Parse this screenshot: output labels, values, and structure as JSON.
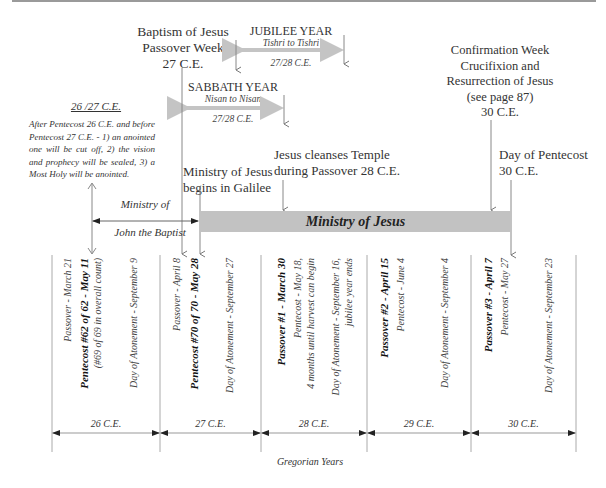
{
  "top_labels": {
    "baptism": [
      "Baptism of Jesus",
      "Passover Week",
      "27 C.E."
    ],
    "jubilee": {
      "title": "JUBILEE YEAR",
      "range": "Tishri to Tishri",
      "year": "27/28 C.E."
    },
    "sabbath": {
      "title": "SABBATH YEAR",
      "range": "Nisan to Nisan",
      "year": "27/28 C.E."
    },
    "confirmation": [
      "Confirmation Week",
      "Crucifixion and",
      "Resurrection of Jesus",
      "(see page 87)",
      "30 C.E."
    ],
    "note": {
      "heading": "26 /27 C.E.",
      "body": "After Pentecost 26 C.E. and before Pentecost 27 C.E. - 1) an anointed one will be cut off, 2) the vision and prophecy will be sealed, 3) a Most Holy will be anointed."
    },
    "ministry_galilee": [
      "Ministry of Jesus",
      "begins in Galilee"
    ],
    "cleanses_temple": [
      "Jesus cleanses Temple",
      "during Passover 28 C.E."
    ],
    "pentecost_30": [
      "Day of Pentecost",
      "30 C.E."
    ]
  },
  "john_baptist": [
    "Ministry of",
    "John the Baptist"
  ],
  "ministry_bar": {
    "label": "Ministry of Jesus",
    "color": "#c2c2c2"
  },
  "columns": [
    {
      "x": 68,
      "lines": [
        "Passover - March 21"
      ],
      "bold": false
    },
    {
      "x": 84,
      "lines": [
        "Pentecost #62 of 62 - May 11"
      ],
      "bold": true
    },
    {
      "x": 98,
      "lines": [
        "(#69 of 69 in overall count)"
      ],
      "bold": false
    },
    {
      "x": 134,
      "lines": [
        "Day of Atonement - September 9"
      ],
      "bold": false
    },
    {
      "x": 177,
      "lines": [
        "Passover - April 8"
      ],
      "bold": false
    },
    {
      "x": 194,
      "lines": [
        "Pentecost #70 of 70 - May 28"
      ],
      "bold": true
    },
    {
      "x": 230,
      "lines": [
        "Day of Atonement - September 27"
      ],
      "bold": false
    },
    {
      "x": 281,
      "lines": [
        "Passover #1 - March 30"
      ],
      "bold": true
    },
    {
      "x": 298,
      "lines": [
        "Pentecost - May 18,"
      ],
      "bold": false
    },
    {
      "x": 311,
      "lines": [
        "4 months until harvest can begin"
      ],
      "bold": false
    },
    {
      "x": 336,
      "lines": [
        "Day of Atonement - September 16,"
      ],
      "bold": false
    },
    {
      "x": 349,
      "lines": [
        "jubilee year ends"
      ],
      "bold": false
    },
    {
      "x": 384,
      "lines": [
        "Passover #2 - April 15"
      ],
      "bold": true
    },
    {
      "x": 401,
      "lines": [
        "Pentecost - June 4"
      ],
      "bold": false
    },
    {
      "x": 445,
      "lines": [
        "Day of Atonement - September 4"
      ],
      "bold": false
    },
    {
      "x": 488,
      "lines": [
        "Passover #3 - April 7"
      ],
      "bold": true
    },
    {
      "x": 505,
      "lines": [
        "Pentecost - May 27"
      ],
      "bold": false
    },
    {
      "x": 549,
      "lines": [
        "Day of Atonement - September 23"
      ],
      "bold": false
    }
  ],
  "years": [
    "26 C.E.",
    "27 C.E.",
    "28 C.E.",
    "29 C.E.",
    "30 C.E."
  ],
  "axis_label": "Gregorian Years"
}
